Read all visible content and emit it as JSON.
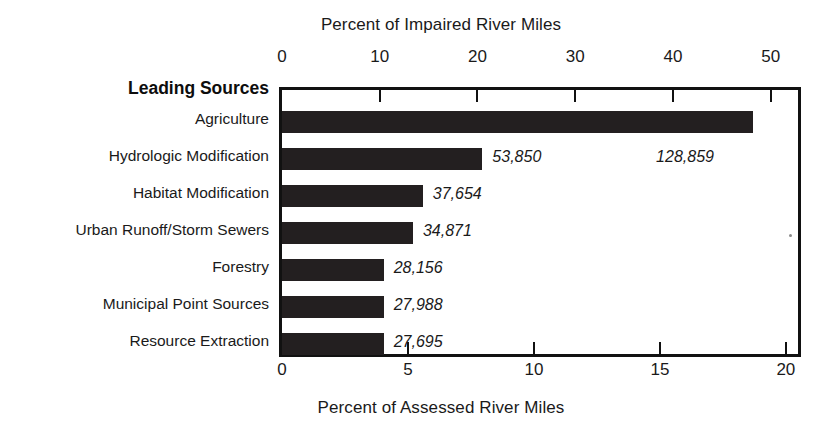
{
  "chart_data": {
    "type": "bar",
    "orientation": "horizontal",
    "title": "",
    "top_axis": {
      "label": "Percent of Impaired River Miles",
      "ticks": [
        0,
        10,
        20,
        30,
        40,
        50
      ],
      "tick_labels": [
        "0",
        "10",
        "20",
        "30",
        "40",
        "50"
      ],
      "range": [
        0,
        53.1
      ]
    },
    "bottom_axis": {
      "label": "Percent of Assessed River Miles",
      "ticks": [
        0,
        5,
        10,
        15,
        20
      ],
      "tick_labels": [
        "0",
        "5",
        "10",
        "15",
        "20"
      ],
      "range": [
        0,
        20.6
      ]
    },
    "category_axis_title": "Leading Sources",
    "categories": [
      "Agriculture",
      "Hydrologic Modification",
      "Habitat Modification",
      "Urban Runoff/Storm Sewers",
      "Forestry",
      "Municipal Point Sources",
      "Resource Extraction"
    ],
    "values_percent_impaired": [
      48.2,
      20.5,
      14.4,
      13.4,
      10.4,
      10.4,
      10.4
    ],
    "values_percent_assessed": [
      18.7,
      8.0,
      5.6,
      5.2,
      4.0,
      4.0,
      4.0
    ],
    "data_labels": [
      "128,859",
      "53,850",
      "37,654",
      "34,871",
      "28,156",
      "27,988",
      "27,695"
    ],
    "data_label_units": "river miles",
    "grid": false,
    "legend": false,
    "bar_color": "#231f20",
    "background_color": "#ffffff"
  },
  "figure": {
    "top_axis_title": "Percent of Impaired River Miles",
    "bottom_axis_title": "Percent of Assessed River Miles",
    "category_header": "Leading Sources",
    "top_ticks": [
      "0",
      "10",
      "20",
      "30",
      "40",
      "50"
    ],
    "bottom_ticks": [
      "0",
      "5",
      "10",
      "15",
      "20"
    ],
    "rows": [
      {
        "label": "Agriculture",
        "value_label": "128,859"
      },
      {
        "label": "Hydrologic Modification",
        "value_label": "53,850"
      },
      {
        "label": "Habitat Modification",
        "value_label": "37,654"
      },
      {
        "label": "Urban Runoff/Storm Sewers",
        "value_label": "34,871"
      },
      {
        "label": "Forestry",
        "value_label": "28,156"
      },
      {
        "label": "Municipal Point Sources",
        "value_label": "27,988"
      },
      {
        "label": "Resource Extraction",
        "value_label": "27,695"
      }
    ]
  }
}
